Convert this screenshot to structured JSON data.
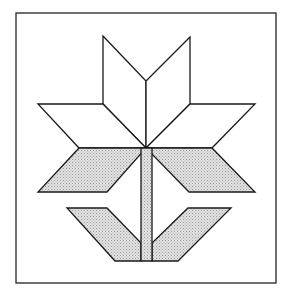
{
  "figure": {
    "colors": {
      "background": "#ffffff",
      "line": "#1a1a1a",
      "shade": "#d2d2d2",
      "frame": "#333333"
    },
    "frame": {
      "x": 16,
      "y": 13,
      "width": 260,
      "height": 270
    },
    "shapes": {
      "top_left_petal": "103,36 146,81 146,148 103,104",
      "top_right_petal": "190,37 146,81 146,148 190,104",
      "left_petal": "38,104 103,104 146,148 79,148",
      "right_petal": "190,104 255,104 212,148 146,148",
      "left_shaded_petal": "79,148 146,148 107,192 38,192",
      "right_shaded_petal": "146,148 212,148 255,192 189,192",
      "left_leaf": "67,208 107,208 141,243 141,261 115,261",
      "right_leaf": "188,208 231,208 178,261 152,261 152,243",
      "stem": "141,148 152,148 152,261 141,261"
    }
  }
}
